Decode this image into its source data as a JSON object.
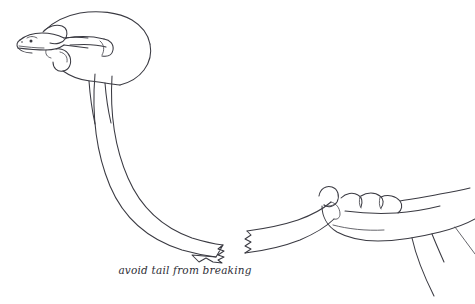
{
  "figure": {
    "title": "avoid tail from breaking",
    "caption": "avoid tail from breaking",
    "medium": "line drawing",
    "background_color": "#ffffff",
    "ink_color": "#3a3a42",
    "elements": {
      "left_hand_label": "left hand holding lizard body",
      "lizard_head_label": "lizard head",
      "lizard_eye_label": "lizard eye",
      "lizard_body_label": "curved lizard body and tail",
      "break_label": "jagged tail break",
      "tail_segment_label": "detached tail segment",
      "right_hand_label": "right hand gripping tail",
      "wrist_label": "right wrist and sleeve"
    }
  }
}
